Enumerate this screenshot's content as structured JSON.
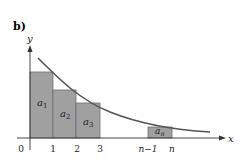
{
  "panel_label": "b)",
  "axes": {
    "x_label": "x",
    "y_label": "y",
    "origin_label": "0",
    "ticks": [
      "1",
      "2",
      "3",
      "n−1",
      "n"
    ]
  },
  "rectangles": [
    {
      "label": "a",
      "sub": "1"
    },
    {
      "label": "a",
      "sub": "2"
    },
    {
      "label": "a",
      "sub": "3"
    },
    {
      "label": "a",
      "sub": "n"
    }
  ],
  "colors": {
    "rect_fill": "#a0a0a0",
    "rect_stroke": "#6e6e6e",
    "curve": "#555555",
    "axis": "#333333"
  }
}
